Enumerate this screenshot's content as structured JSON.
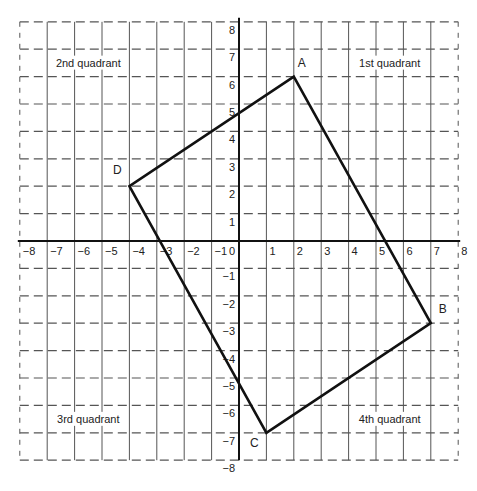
{
  "diagram": {
    "type": "coordinate-plane",
    "x_range": [
      -8,
      8
    ],
    "y_range": [
      -8,
      8
    ],
    "origin_label": "0",
    "x_ticks": [
      "-8",
      "-7",
      "-6",
      "-5",
      "-4",
      "-3",
      "-2",
      "-1",
      "1",
      "2",
      "3",
      "4",
      "5",
      "6",
      "7",
      "8"
    ],
    "y_ticks": [
      "8",
      "7",
      "6",
      "5",
      "4",
      "3",
      "2",
      "1",
      "-1",
      "-2",
      "-3",
      "-4",
      "-5",
      "-6",
      "-7",
      "-8"
    ],
    "quadrants": [
      {
        "label": "1st quadrant",
        "x": 5.5,
        "y": 6.4
      },
      {
        "label": "2nd quadrant",
        "x": -5.5,
        "y": 6.4
      },
      {
        "label": "3rd quadrant",
        "x": -5.5,
        "y": -6.6
      },
      {
        "label": "4th quadrant",
        "x": 5.5,
        "y": -6.6
      }
    ],
    "polygon": {
      "vertices": [
        {
          "label": "A",
          "x": 2,
          "y": 6,
          "label_dx": 8,
          "label_dy": -10
        },
        {
          "label": "B",
          "x": 7,
          "y": -3,
          "label_dx": 12,
          "label_dy": -10
        },
        {
          "label": "C",
          "x": 1,
          "y": -7,
          "label_dx": -12,
          "label_dy": 14
        },
        {
          "label": "D",
          "x": -4,
          "y": 2,
          "label_dx": -12,
          "label_dy": -12
        }
      ]
    }
  },
  "chart_data": {
    "type": "scatter",
    "title": "",
    "xlabel": "",
    "ylabel": "",
    "xlim": [
      -8,
      8
    ],
    "ylim": [
      -8,
      8
    ],
    "grid": true,
    "x_tick_labels": [
      "-8",
      "-7",
      "-6",
      "-5",
      "-4",
      "-3",
      "-2",
      "-1",
      "0",
      "1",
      "2",
      "3",
      "4",
      "5",
      "6",
      "7",
      "8"
    ],
    "y_tick_labels": [
      "-8",
      "-7",
      "-6",
      "-5",
      "-4",
      "-3",
      "-2",
      "-1",
      "1",
      "2",
      "3",
      "4",
      "5",
      "6",
      "7",
      "8"
    ],
    "series": [
      {
        "name": "Quadrilateral ABCD",
        "closed": true,
        "points": [
          {
            "label": "A",
            "x": 2,
            "y": 6
          },
          {
            "label": "B",
            "x": 7,
            "y": -3
          },
          {
            "label": "C",
            "x": 1,
            "y": -7
          },
          {
            "label": "D",
            "x": -4,
            "y": 2
          }
        ]
      }
    ],
    "annotations": [
      "1st quadrant",
      "2nd quadrant",
      "3rd quadrant",
      "4th quadrant"
    ]
  },
  "style": {
    "grid_color": "#555555",
    "axis_color": "#111111",
    "shape_color": "#111111",
    "background": "#ffffff"
  }
}
